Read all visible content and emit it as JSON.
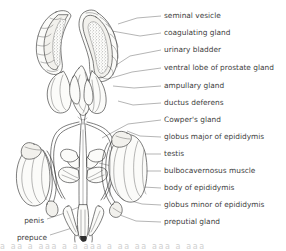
{
  "figure": {
    "style": "line drawing with stipple shading",
    "ink_color": "#2e2e2e",
    "label_color": "#3d3d3d",
    "leader_color": "#6b6b6b",
    "background_color": "#ffffff"
  },
  "labels_right": [
    {
      "id": "seminal-vesicle",
      "text": "seminal vesicle",
      "y": 16
    },
    {
      "id": "coagulating-gland",
      "text": "coagulating gland",
      "y": 33
    },
    {
      "id": "urinary-bladder",
      "text": "urinary bladder",
      "y": 50
    },
    {
      "id": "ventral-lobe-of-prostate-gland",
      "text": "ventral lobe of prostate gland",
      "y": 68
    },
    {
      "id": "ampullary-gland",
      "text": "ampullary gland",
      "y": 86
    },
    {
      "id": "ductus-deferens",
      "text": "ductus deferens",
      "y": 103
    },
    {
      "id": "cowpers-gland",
      "text": "Cowper's gland",
      "y": 120
    },
    {
      "id": "globus-major-of-epididymis",
      "text": "globus major of epididymis",
      "y": 137
    },
    {
      "id": "testis",
      "text": "testis",
      "y": 154
    },
    {
      "id": "bulbocavernosus-muscle",
      "text": "bulbocavernosus muscle",
      "y": 171
    },
    {
      "id": "body-of-epididymis",
      "text": "body of epididymis",
      "y": 188
    },
    {
      "id": "globus-minor-of-epididymis",
      "text": "globus minor of epididymis",
      "y": 205
    },
    {
      "id": "preputial-gland",
      "text": "preputial gland",
      "y": 222
    }
  ],
  "labels_left": [
    {
      "id": "penis",
      "text": "penis",
      "y": 221
    },
    {
      "id": "prepuce",
      "text": "prepuce",
      "y": 238
    }
  ],
  "caption_cropped": "a aa a aaa a a aaa a aa aa aaa a aaa"
}
